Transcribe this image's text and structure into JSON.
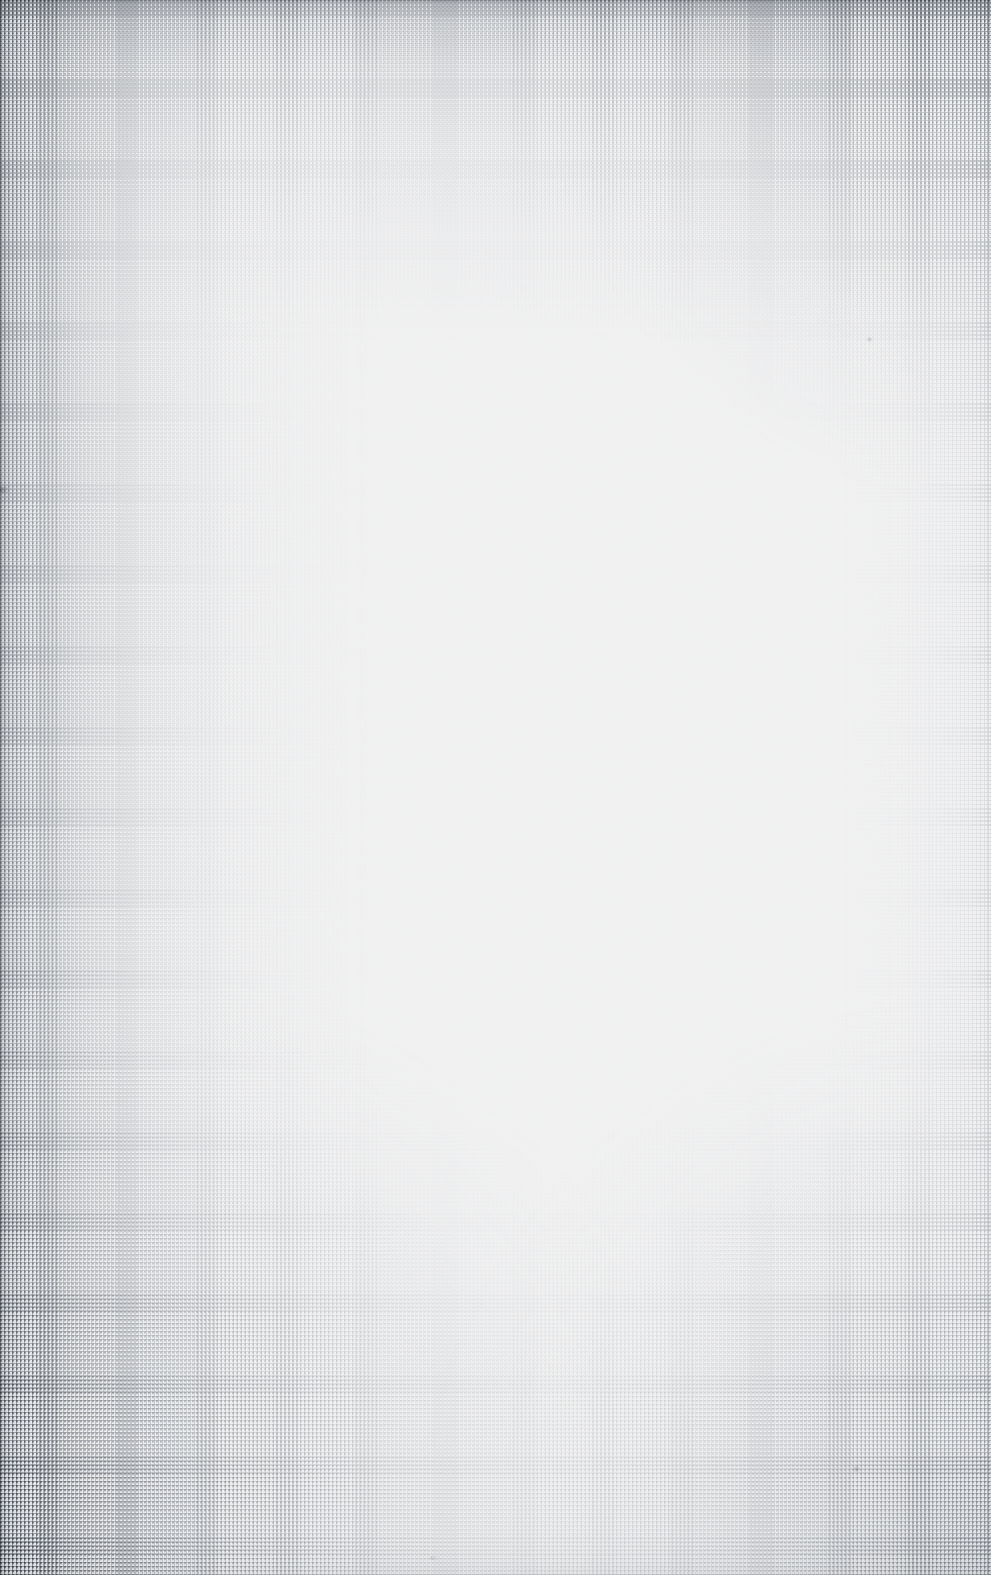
{
  "document": {
    "kind": "scanned-page",
    "content_text": "",
    "page_width_px": 991,
    "page_height_px": 1575
  },
  "surface": {
    "paper_color": "#fefefe",
    "paper_color_center": "#ffffff",
    "texture_name": "woven-linen-halftone",
    "texture_thread_color": "#969ba2",
    "texture_dot_color": "#828891",
    "texture_pitch_px": 4,
    "edge_line_color": "#787c82",
    "shadow_color": "#a4a8ae"
  },
  "regions": [
    {
      "name": "left-edge-weave",
      "intensity": "strong"
    },
    {
      "name": "top-edge-weave",
      "intensity": "medium"
    },
    {
      "name": "bottom-left-corner-weave",
      "intensity": "strong"
    },
    {
      "name": "bottom-right-corner-weave",
      "intensity": "medium"
    },
    {
      "name": "top-right-weave",
      "intensity": "light"
    },
    {
      "name": "center-field",
      "intensity": "none"
    }
  ],
  "artifacts": [
    {
      "name": "speck-upper-right",
      "x": 866,
      "y": 337
    },
    {
      "name": "nick-left-edge",
      "x": 0,
      "y": 487
    },
    {
      "name": "fleck-lower-right",
      "x": 852,
      "y": 1466
    },
    {
      "name": "fleck-bottom-center",
      "x": 430,
      "y": 1556
    }
  ]
}
